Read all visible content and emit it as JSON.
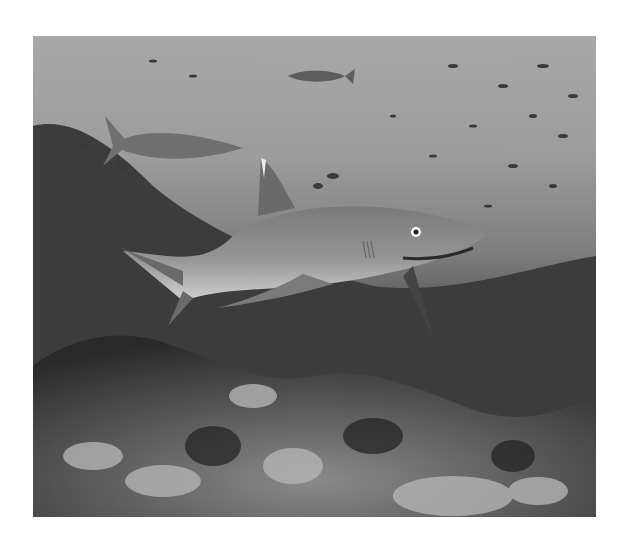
{
  "image": {
    "subject": "whitetip reef shark swimming over coral reef with schools of small fish",
    "style": "grayscale underwater photograph",
    "colors": {
      "background": "#ffffff",
      "water_top": "#a8a8a8",
      "water_mid": "#7e7e7e",
      "reef_dark": "#2e2e2e",
      "shark_body": "#8c8c8c",
      "shark_belly": "#c8c8c8"
    }
  }
}
